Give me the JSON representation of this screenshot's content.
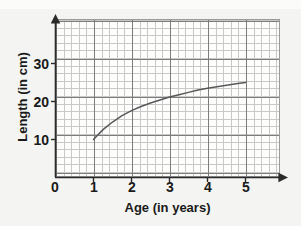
{
  "chart_data": {
    "type": "line",
    "title": "",
    "xlabel": "Age (in years)",
    "ylabel": "Length (in cm)",
    "xlim": [
      0,
      5.9
    ],
    "ylim": [
      0,
      41.5
    ],
    "xticks": [
      "0",
      "1",
      "2",
      "3",
      "4",
      "5"
    ],
    "xtick_values": [
      0,
      1,
      2,
      3,
      4,
      5
    ],
    "yticks": [
      "10",
      "20",
      "30"
    ],
    "ytick_values": [
      10,
      20,
      30
    ],
    "grid": "minor grid every 2 units with major gridlines at each labeled tick",
    "legend": "none",
    "x": [
      1,
      1.25,
      1.5,
      1.75,
      2,
      2.25,
      2.5,
      2.75,
      3,
      3.25,
      3.5,
      3.75,
      4,
      4.25,
      4.5,
      4.75,
      5
    ],
    "values": [
      10.0,
      12.6,
      14.6,
      16.3,
      17.6,
      18.7,
      19.6,
      20.4,
      21.2,
      21.8,
      22.4,
      23.0,
      23.5,
      23.9,
      24.3,
      24.7,
      25.0
    ],
    "series": [
      {
        "name": "length-vs-age",
        "color": "#58585a",
        "values": [
          10.0,
          12.6,
          14.6,
          16.3,
          17.6,
          18.7,
          19.6,
          20.4,
          21.2,
          21.8,
          22.4,
          23.0,
          23.5,
          23.9,
          24.3,
          24.7,
          25.0
        ]
      }
    ],
    "annotations": []
  },
  "axes": {
    "x_arrow": "arrow-right",
    "y_arrow": "arrow-up",
    "axis_color": "#2b2b2b"
  },
  "labels": {
    "x_title": "Age (in years)",
    "y_title": "Length (in cm)",
    "x_ticks": [
      "0",
      "1",
      "2",
      "3",
      "4",
      "5"
    ],
    "y_ticks": [
      "10",
      "20",
      "30"
    ]
  }
}
